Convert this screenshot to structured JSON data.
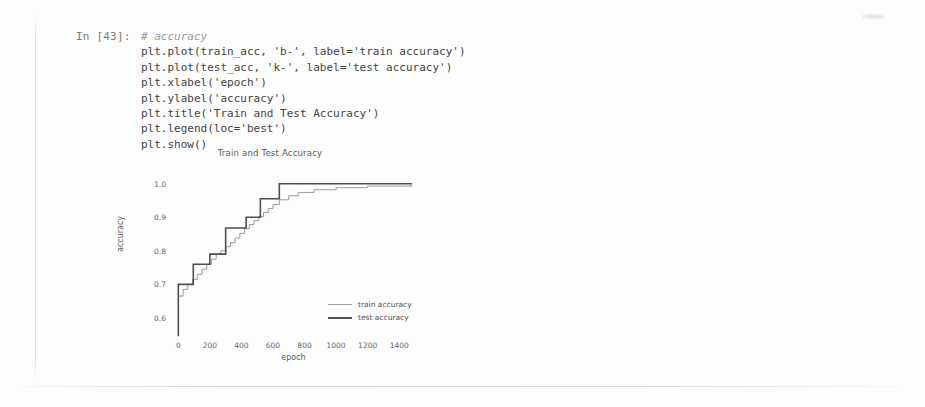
{
  "notebook": {
    "prompt_label": "In [43]:",
    "code_lines": [
      {
        "text": "# accuracy",
        "style": "comment"
      },
      {
        "text": "plt.plot(train_acc, 'b-', label='train accuracy')",
        "style": "code"
      },
      {
        "text": "plt.plot(test_acc, 'k-', label='test accuracy')",
        "style": "code"
      },
      {
        "text": "plt.xlabel('epoch')",
        "style": "code"
      },
      {
        "text": "plt.ylabel('accuracy')",
        "style": "code"
      },
      {
        "text": "plt.title('Train and Test Accuracy')",
        "style": "code"
      },
      {
        "text": "plt.legend(loc='best')",
        "style": "code"
      },
      {
        "text": "plt.show()",
        "style": "code"
      }
    ]
  },
  "chart_data": {
    "type": "line",
    "title": "Train and Test Accuracy",
    "xlabel": "epoch",
    "ylabel": "accuracy",
    "xlim": [
      -40,
      1500
    ],
    "ylim": [
      0.54,
      1.02
    ],
    "xticks": [
      0,
      200,
      400,
      600,
      800,
      1000,
      1200,
      1400
    ],
    "yticks": [
      0.6,
      0.7,
      0.8,
      0.9,
      1.0
    ],
    "ytick_labels": [
      "0.6",
      "0.7",
      "0.8",
      "0.9",
      "1.0"
    ],
    "grid": false,
    "legend_position": "center-right",
    "series": [
      {
        "name": "train accuracy",
        "color": "#9b9b9b",
        "width": 1,
        "drawstyle": "steps-post",
        "x": [
          0,
          30,
          60,
          90,
          120,
          150,
          180,
          210,
          240,
          270,
          300,
          330,
          360,
          390,
          420,
          450,
          480,
          510,
          540,
          570,
          600,
          640,
          700,
          760,
          860,
          1000,
          1200,
          1480
        ],
        "y": [
          0.665,
          0.685,
          0.7,
          0.715,
          0.73,
          0.745,
          0.76,
          0.775,
          0.79,
          0.8,
          0.812,
          0.824,
          0.838,
          0.852,
          0.866,
          0.878,
          0.89,
          0.902,
          0.914,
          0.926,
          0.938,
          0.952,
          0.964,
          0.974,
          0.982,
          0.988,
          0.993,
          0.996
        ]
      },
      {
        "name": "test accuracy",
        "color": "#4f4f4f",
        "width": 1.6,
        "drawstyle": "steps-post",
        "x": [
          0,
          0,
          95,
          95,
          200,
          200,
          300,
          300,
          430,
          430,
          520,
          520,
          640,
          640,
          1480
        ],
        "y": [
          0.545,
          0.7,
          0.7,
          0.76,
          0.76,
          0.79,
          0.79,
          0.868,
          0.868,
          0.9,
          0.9,
          0.955,
          0.955,
          1.0,
          1.0
        ]
      }
    ],
    "legend": [
      {
        "label": "train accuracy",
        "color": "#9b9b9b"
      },
      {
        "label": "test accuracy",
        "color": "#4f4f4f"
      }
    ]
  }
}
